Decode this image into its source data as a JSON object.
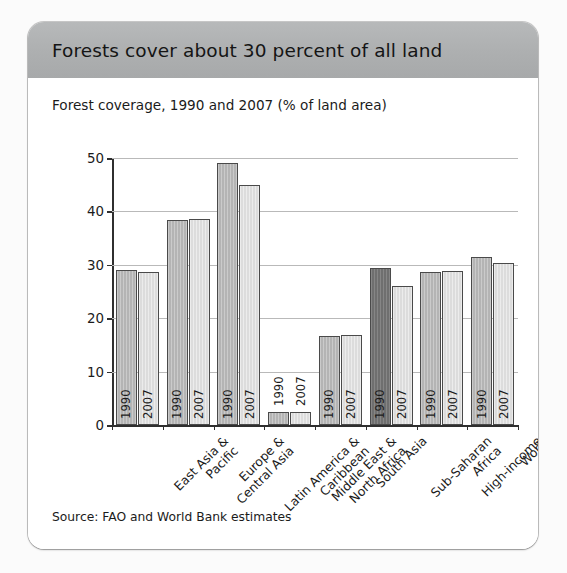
{
  "card": {
    "title": "Forests cover about 30 percent of all land",
    "subtitle": "Forest coverage, 1990 and 2007 (% of land area)",
    "source": "Source: FAO and World Bank estimates",
    "header_color": "#adafb0",
    "background_color": "#ffffff"
  },
  "chart_data": {
    "type": "bar",
    "title": "Forests cover about 30 percent of all land",
    "subtitle": "Forest coverage, 1990 and 2007 (% of land area)",
    "xlabel": "",
    "ylabel": "",
    "ylim": [
      0,
      50
    ],
    "yticks": [
      "0",
      "10",
      "20",
      "30",
      "40",
      "50"
    ],
    "grid": true,
    "legend": "none",
    "bar_labels_inside": true,
    "categories": [
      "East Asia &\nPacific",
      "Europe &\nCentral Asia",
      "Latin America &\nCaribbean",
      "Middle East &\nNorth Africa",
      "South Asia",
      "Sub-Saharan\nAfrica",
      "High-income",
      "World"
    ],
    "category_labels": [
      [
        "East Asia &",
        "Pacific"
      ],
      [
        "Europe &",
        "Central Asia"
      ],
      [
        "Latin America &",
        "Caribbean"
      ],
      [
        "Middle East &",
        "North Africa"
      ],
      [
        "South Asia"
      ],
      [
        "Sub-Saharan",
        "Africa"
      ],
      [
        "High-income"
      ],
      [
        "World"
      ]
    ],
    "series": [
      {
        "name": "1990",
        "color": "#b4b4b4",
        "values": [
          29.0,
          38.3,
          49.0,
          2.4,
          16.6,
          29.4,
          28.7,
          31.4
        ]
      },
      {
        "name": "2007",
        "color": "#dcdcdc",
        "values": [
          28.6,
          38.6,
          45.0,
          2.5,
          16.9,
          26.1,
          28.9,
          30.3
        ]
      }
    ],
    "dark_highlight": {
      "series": "1990",
      "category_index": 5,
      "color": "#6f6f6f"
    }
  }
}
